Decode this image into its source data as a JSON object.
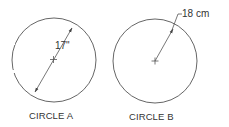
{
  "diagram": {
    "circles": [
      {
        "id": "A",
        "caption": "CIRCLE A",
        "dimension_label": "17\"",
        "dimension_type": "diameter",
        "value": 17,
        "unit": "in"
      },
      {
        "id": "B",
        "caption": "CIRCLE B",
        "dimension_label": "18 cm",
        "dimension_type": "radius",
        "value": 18,
        "unit": "cm"
      }
    ],
    "colors": {
      "line": "#444444",
      "text": "#333333",
      "background": "#ffffff"
    }
  }
}
